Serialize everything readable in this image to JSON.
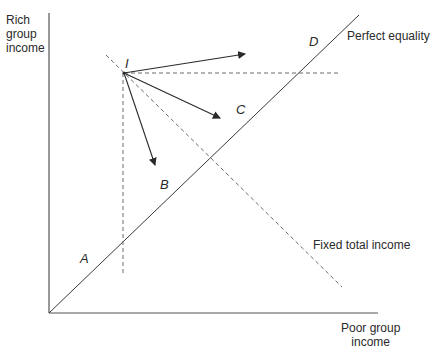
{
  "diagram": {
    "y_axis_label": [
      "Rich",
      "group",
      "income"
    ],
    "x_axis_label": [
      "Poor group",
      "income"
    ],
    "lines": {
      "perfect_equality": "Perfect equality",
      "fixed_total_income": "Fixed total income"
    },
    "points": {
      "I": "I",
      "A": "A",
      "B": "B",
      "C": "C",
      "D": "D"
    },
    "colors": {
      "line": "#3a3a3a",
      "dashed": "#6a6a6a",
      "background": "#ffffff"
    }
  }
}
